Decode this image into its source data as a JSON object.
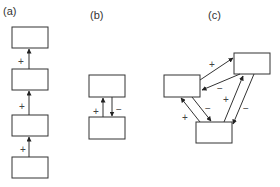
{
  "panels": [
    {
      "id": "a",
      "label": "(a)",
      "description": "linear chain of four boxes with positive upward links",
      "boxes": [
        {
          "id": "a1",
          "x": 12,
          "y": 27,
          "w": 36,
          "h": 21
        },
        {
          "id": "a2",
          "x": 12,
          "y": 69,
          "w": 36,
          "h": 21
        },
        {
          "id": "a3",
          "x": 12,
          "y": 115,
          "w": 36,
          "h": 21
        },
        {
          "id": "a4",
          "x": 12,
          "y": 157,
          "w": 36,
          "h": 21
        }
      ],
      "links": [
        {
          "from": "a2",
          "to": "a1",
          "sign": "+"
        },
        {
          "from": "a3",
          "to": "a2",
          "sign": "+"
        },
        {
          "from": "a4",
          "to": "a3",
          "sign": "+"
        }
      ]
    },
    {
      "id": "b",
      "label": "(b)",
      "description": "two boxes with positive and negative feedback",
      "boxes": [
        {
          "id": "b1",
          "x": 89,
          "y": 75,
          "w": 36,
          "h": 22
        },
        {
          "id": "b2",
          "x": 89,
          "y": 117,
          "w": 36,
          "h": 22
        }
      ],
      "links": [
        {
          "from": "b2",
          "to": "b1",
          "sign": "+"
        },
        {
          "from": "b1",
          "to": "b2",
          "sign": "−"
        }
      ]
    },
    {
      "id": "c",
      "label": "(c)",
      "description": "three boxes with bidirectional feedback loops",
      "boxes": [
        {
          "id": "c_left",
          "x": 164,
          "y": 75,
          "w": 36,
          "h": 22
        },
        {
          "id": "c_right",
          "x": 234,
          "y": 53,
          "w": 36,
          "h": 21
        },
        {
          "id": "c_bottom",
          "x": 196,
          "y": 122,
          "w": 36,
          "h": 21
        }
      ],
      "links": [
        {
          "from": "c_left",
          "to": "c_right",
          "sign": "+"
        },
        {
          "from": "c_right",
          "to": "c_left",
          "sign": "−"
        },
        {
          "from": "c_left",
          "to": "c_bottom",
          "sign": "−"
        },
        {
          "from": "c_bottom",
          "to": "c_left",
          "sign": "+"
        },
        {
          "from": "c_bottom",
          "to": "c_right",
          "sign": "+"
        },
        {
          "from": "c_right",
          "to": "c_bottom",
          "sign": "−"
        }
      ]
    }
  ]
}
